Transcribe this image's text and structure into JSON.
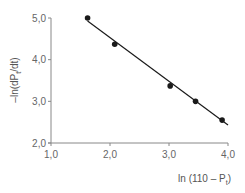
{
  "chart_data": {
    "type": "scatter",
    "title": "",
    "xlabel": "ln (110 – P",
    "xlabel_sub": "t",
    "xlabel_close": ")",
    "ylabel": "–ln(dP",
    "ylabel_sub": "t",
    "ylabel_close": "/dt)",
    "xlim": [
      1.0,
      4.0
    ],
    "ylim": [
      2.0,
      5.0
    ],
    "x_ticks": [
      "1,0",
      "2,0",
      "3,0",
      "4,0"
    ],
    "y_ticks": [
      "2,0",
      "3,0",
      "4,0",
      "5,0"
    ],
    "grid": false,
    "legend": null,
    "series": [
      {
        "name": "data",
        "marker": "circle",
        "color": "#1a1a1a",
        "x": [
          1.62,
          2.08,
          3.02,
          3.45,
          3.9
        ],
        "y": [
          5.0,
          4.37,
          3.37,
          3.0,
          2.55
        ]
      },
      {
        "name": "linear fit",
        "type": "line",
        "color": "#1a1a1a",
        "x": [
          1.62,
          4.0
        ],
        "y": [
          4.93,
          2.43
        ]
      }
    ]
  }
}
